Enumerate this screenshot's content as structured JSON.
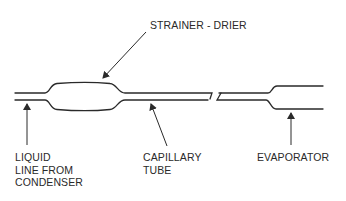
{
  "diagram": {
    "colors": {
      "line": "#2a2a2a",
      "background": "#ffffff",
      "text": "#2a2a2a"
    },
    "labels": {
      "strainer_drier": "STRAINER - DRIER",
      "liquid_line": "LIQUID\nLINE FROM\nCONDENSER",
      "capillary_tube": "CAPILLARY\nTUBE",
      "evaporator": "EVAPORATOR"
    },
    "components": [
      {
        "id": "liquid-line",
        "name": "Liquid line from condenser"
      },
      {
        "id": "strainer-drier",
        "name": "Strainer - drier"
      },
      {
        "id": "capillary-tube",
        "name": "Capillary tube"
      },
      {
        "id": "evaporator",
        "name": "Evaporator"
      }
    ]
  }
}
